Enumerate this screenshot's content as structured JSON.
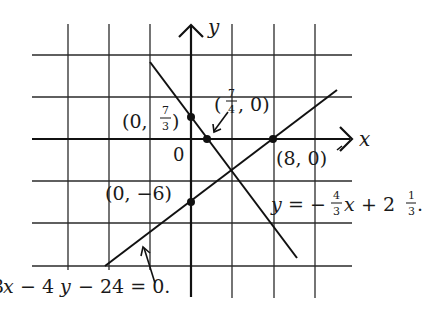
{
  "diagram": {
    "axes": {
      "x_label": "x",
      "y_label": "y",
      "origin_label": "0"
    },
    "points": [
      {
        "label": "(0, 7/3)",
        "open": "(0, ",
        "num": "7",
        "den": "3",
        "close": ")"
      },
      {
        "label": "(7/4, 0)",
        "open": "(",
        "num": "7",
        "den": "4",
        "close": ", 0)"
      },
      {
        "label": "(8, 0)",
        "text": "(8, 0)"
      },
      {
        "label": "(0, -6)",
        "text": "(0, −6)"
      }
    ],
    "lines": [
      {
        "equation": "y = -4/3 x + 2 1/3.",
        "lhs": "y",
        "eq": " = −",
        "frac_num": "4",
        "frac_den": "3",
        "var": "x",
        "plus": " + 2",
        "mixed_num": "1",
        "mixed_den": "3",
        "end": "."
      },
      {
        "equation": "3x - 4y - 24 = 0.",
        "text_a": "3",
        "var_x": "x",
        "text_b": " − 4",
        "var_y": "y",
        "text_c": " − 24 = 0."
      }
    ]
  }
}
